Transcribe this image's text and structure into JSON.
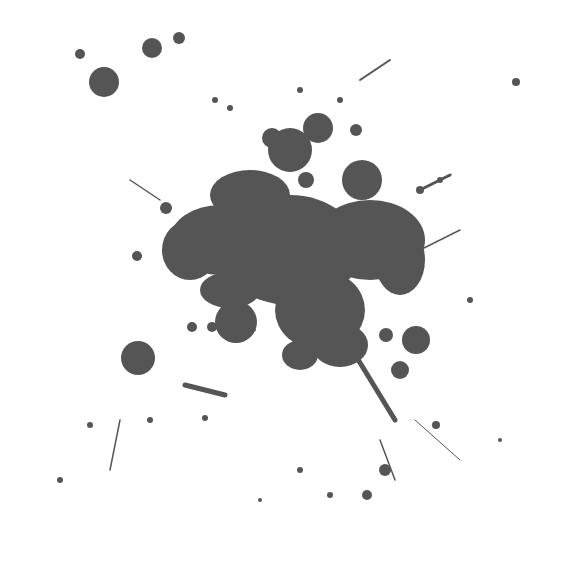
{
  "image": {
    "subject": "ink splatter",
    "ink_color": "#555555",
    "background_color": "#ffffff"
  },
  "blobs": [
    {
      "cx": 104,
      "cy": 82,
      "r": 15
    },
    {
      "cx": 152,
      "cy": 48,
      "r": 10
    },
    {
      "cx": 179,
      "cy": 38,
      "r": 6
    },
    {
      "cx": 80,
      "cy": 54,
      "r": 5
    },
    {
      "cx": 516,
      "cy": 82,
      "r": 4
    },
    {
      "cx": 138,
      "cy": 358,
      "r": 17
    },
    {
      "cx": 236,
      "cy": 322,
      "r": 21
    },
    {
      "cx": 416,
      "cy": 340,
      "r": 14
    },
    {
      "cx": 362,
      "cy": 180,
      "r": 20
    },
    {
      "cx": 290,
      "cy": 150,
      "r": 22
    },
    {
      "cx": 318,
      "cy": 128,
      "r": 15
    },
    {
      "cx": 272,
      "cy": 138,
      "r": 10
    },
    {
      "cx": 400,
      "cy": 370,
      "r": 9
    },
    {
      "cx": 386,
      "cy": 335,
      "r": 7
    },
    {
      "cx": 385,
      "cy": 470,
      "r": 6
    },
    {
      "cx": 367,
      "cy": 495,
      "r": 5
    },
    {
      "cx": 436,
      "cy": 425,
      "r": 4
    },
    {
      "cx": 356,
      "cy": 130,
      "r": 6
    },
    {
      "cx": 306,
      "cy": 180,
      "r": 8
    },
    {
      "cx": 192,
      "cy": 327,
      "r": 5
    },
    {
      "cx": 212,
      "cy": 327,
      "r": 5
    },
    {
      "cx": 150,
      "cy": 420,
      "r": 3
    },
    {
      "cx": 205,
      "cy": 418,
      "r": 3
    },
    {
      "cx": 137,
      "cy": 256,
      "r": 5
    },
    {
      "cx": 166,
      "cy": 208,
      "r": 6
    },
    {
      "cx": 230,
      "cy": 108,
      "r": 3
    },
    {
      "cx": 215,
      "cy": 100,
      "r": 3
    },
    {
      "cx": 300,
      "cy": 90,
      "r": 3
    },
    {
      "cx": 340,
      "cy": 100,
      "r": 3
    },
    {
      "cx": 420,
      "cy": 190,
      "r": 4
    },
    {
      "cx": 440,
      "cy": 180,
      "r": 3
    },
    {
      "cx": 470,
      "cy": 300,
      "r": 3
    },
    {
      "cx": 90,
      "cy": 425,
      "r": 3
    },
    {
      "cx": 60,
      "cy": 480,
      "r": 3
    },
    {
      "cx": 330,
      "cy": 495,
      "r": 3
    },
    {
      "cx": 300,
      "cy": 470,
      "r": 3
    },
    {
      "cx": 260,
      "cy": 500,
      "r": 2
    },
    {
      "cx": 500,
      "cy": 440,
      "r": 2
    }
  ],
  "main_mass": [
    {
      "cx": 290,
      "cy": 250,
      "rx": 70,
      "ry": 55
    },
    {
      "cx": 220,
      "cy": 240,
      "rx": 50,
      "ry": 35
    },
    {
      "cx": 370,
      "cy": 240,
      "rx": 55,
      "ry": 40
    },
    {
      "cx": 320,
      "cy": 310,
      "rx": 45,
      "ry": 40
    },
    {
      "cx": 250,
      "cy": 195,
      "rx": 40,
      "ry": 25
    },
    {
      "cx": 190,
      "cy": 250,
      "rx": 28,
      "ry": 30
    },
    {
      "cx": 340,
      "cy": 345,
      "rx": 28,
      "ry": 22
    },
    {
      "cx": 300,
      "cy": 355,
      "rx": 18,
      "ry": 15
    },
    {
      "cx": 400,
      "cy": 260,
      "rx": 25,
      "ry": 35
    },
    {
      "cx": 230,
      "cy": 290,
      "rx": 30,
      "ry": 18
    }
  ],
  "streaks": [
    {
      "x1": 340,
      "y1": 330,
      "x2": 395,
      "y2": 420,
      "w": 5
    },
    {
      "x1": 360,
      "y1": 80,
      "x2": 390,
      "y2": 60,
      "w": 2
    },
    {
      "x1": 420,
      "y1": 190,
      "x2": 450,
      "y2": 175,
      "w": 3
    },
    {
      "x1": 185,
      "y1": 385,
      "x2": 225,
      "y2": 395,
      "w": 5
    },
    {
      "x1": 110,
      "y1": 470,
      "x2": 120,
      "y2": 420,
      "w": 1.5
    },
    {
      "x1": 380,
      "y1": 440,
      "x2": 395,
      "y2": 480,
      "w": 1.5
    },
    {
      "x1": 415,
      "y1": 420,
      "x2": 460,
      "y2": 460,
      "w": 1
    },
    {
      "x1": 130,
      "y1": 180,
      "x2": 160,
      "y2": 200,
      "w": 1.5
    },
    {
      "x1": 230,
      "y1": 340,
      "x2": 255,
      "y2": 330,
      "w": 2
    },
    {
      "x1": 420,
      "y1": 250,
      "x2": 460,
      "y2": 230,
      "w": 1.5
    }
  ]
}
